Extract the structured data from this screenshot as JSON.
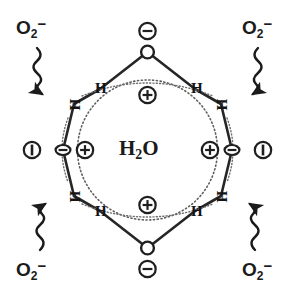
{
  "diagram": {
    "title": "H2O",
    "center_label": {
      "formula": "H",
      "sub": "2",
      "tail": "O",
      "plain": "H2O"
    },
    "ring": {
      "shape": "octagon",
      "vertices": 8,
      "oxygen_count": 4,
      "hydrogen_count": 8,
      "inner_guide": "dotted-circle"
    },
    "atoms": [
      {
        "id": "H-top-left",
        "label": "H",
        "rotation": 0
      },
      {
        "id": "H-upper-left",
        "label": "H",
        "rotation": 90
      },
      {
        "id": "H-lower-left",
        "label": "H",
        "rotation": 90
      },
      {
        "id": "H-bottom-left",
        "label": "H",
        "rotation": 0
      },
      {
        "id": "H-bottom-right",
        "label": "H",
        "rotation": 0
      },
      {
        "id": "H-lower-right",
        "label": "H",
        "rotation": 90
      },
      {
        "id": "H-upper-right",
        "label": "H",
        "rotation": 90
      },
      {
        "id": "H-top-right",
        "label": "H",
        "rotation": 0
      }
    ],
    "charges": [
      {
        "id": "charge-outer-top",
        "sign": "minus",
        "glyph": "−",
        "position": "top-outer"
      },
      {
        "id": "charge-inner-top",
        "sign": "plus",
        "glyph": "+",
        "position": "top-inner"
      },
      {
        "id": "charge-outer-bottom",
        "sign": "minus",
        "glyph": "−",
        "position": "bottom-outer"
      },
      {
        "id": "charge-inner-bottom",
        "sign": "plus",
        "glyph": "+",
        "position": "bottom-inner"
      },
      {
        "id": "charge-inner-left",
        "sign": "plus",
        "glyph": "+",
        "position": "left-inner"
      },
      {
        "id": "charge-outer-left",
        "sign": "bar",
        "glyph": "|",
        "position": "left-outer"
      },
      {
        "id": "charge-inner-right",
        "sign": "plus",
        "glyph": "+",
        "position": "right-inner"
      },
      {
        "id": "charge-outer-right",
        "sign": "bar",
        "glyph": "|",
        "position": "right-outer"
      }
    ],
    "reactants": [
      {
        "id": "superoxide-top-left",
        "formula": "O",
        "sub": "2",
        "sup": "−",
        "plain": "O2-",
        "corner": "top-left"
      },
      {
        "id": "superoxide-top-right",
        "formula": "O",
        "sub": "2",
        "sup": "−",
        "plain": "O2-",
        "corner": "top-right"
      },
      {
        "id": "superoxide-bottom-left",
        "formula": "O",
        "sub": "2",
        "sup": "−",
        "plain": "O2-",
        "corner": "bottom-left"
      },
      {
        "id": "superoxide-bottom-right",
        "formula": "O",
        "sub": "2",
        "sup": "−",
        "plain": "O2-",
        "corner": "bottom-right"
      }
    ],
    "arrows": [
      {
        "id": "wavy-arrow-top-left",
        "style": "wavy",
        "points_to": "H-upper-left"
      },
      {
        "id": "wavy-arrow-top-right",
        "style": "wavy",
        "points_to": "H-upper-right"
      },
      {
        "id": "wavy-arrow-bottom-left",
        "style": "wavy",
        "points_to": "H-lower-left"
      },
      {
        "id": "wavy-arrow-bottom-right",
        "style": "wavy",
        "points_to": "H-lower-right"
      }
    ],
    "colors": {
      "ink": "#1b1b1b",
      "bond": "#262626",
      "dotted": "#6b6b6b",
      "background": "#ffffff"
    }
  }
}
